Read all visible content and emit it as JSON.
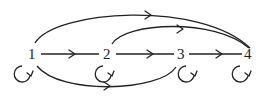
{
  "diagram": {
    "type": "directed-graph",
    "nodes": [
      {
        "id": "1",
        "label": "1",
        "x": 32,
        "y": 55
      },
      {
        "id": "2",
        "label": "2",
        "x": 107,
        "y": 55
      },
      {
        "id": "3",
        "label": "3",
        "x": 180,
        "y": 55
      },
      {
        "id": "4",
        "label": "4",
        "x": 248,
        "y": 55
      }
    ],
    "edges": [
      {
        "from": "1",
        "to": "2",
        "shape": "straight"
      },
      {
        "from": "2",
        "to": "3",
        "shape": "straight"
      },
      {
        "from": "3",
        "to": "4",
        "shape": "straight"
      },
      {
        "from": "1",
        "to": "4",
        "shape": "arc-top"
      },
      {
        "from": "2",
        "to": "4",
        "shape": "arc-top"
      },
      {
        "from": "1",
        "to": "3",
        "shape": "arc-bottom"
      },
      {
        "from": "1",
        "to": "1",
        "shape": "self-loop"
      },
      {
        "from": "2",
        "to": "2",
        "shape": "self-loop"
      },
      {
        "from": "3",
        "to": "3",
        "shape": "self-loop"
      },
      {
        "from": "4",
        "to": "4",
        "shape": "self-loop"
      }
    ],
    "colors": {
      "stroke": "#222222",
      "background": "#ffffff"
    }
  }
}
